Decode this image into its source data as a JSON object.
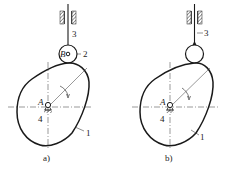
{
  "figure_a": {
    "caption": "a)",
    "labels": {
      "cam": "1",
      "roller": "2",
      "follower": "3",
      "frame": "4",
      "pivot": "A",
      "roller_center": "B"
    },
    "follower_type": "roller follower"
  },
  "figure_b": {
    "caption": "b)",
    "labels": {
      "cam": "1",
      "follower": "3",
      "frame": "4",
      "pivot": "A"
    },
    "follower_type": "roller integrated with follower"
  },
  "colors": {
    "line": "#1a1a1a",
    "background": "#ffffff"
  }
}
